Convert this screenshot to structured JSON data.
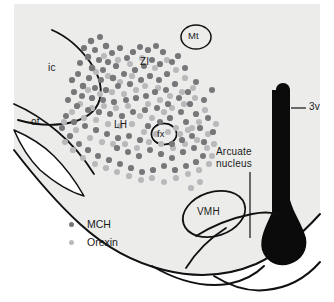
{
  "figure": {
    "kind": "hypothalamus-coronal-section-schematic",
    "background_color": "#ffffff",
    "tissue_fill": "#ececeb",
    "tissue_fill_dark": "#e4e4e3",
    "outline_color": "#111111",
    "ventricle_fill": "#0b0b0b",
    "text_color": "#1a1a1a"
  },
  "labels": {
    "ic": "ic",
    "ot": "ot",
    "zi": "ZI",
    "lh": "LH",
    "fx": "fx",
    "mt": "Mt",
    "third_ventricle": "3v",
    "vmh": "VMH",
    "arcuate_line1": "Arcuate",
    "arcuate_line2": "nucleus"
  },
  "legend": {
    "items": [
      {
        "label": "MCH",
        "color": "#77777a",
        "marker": "filled-circle"
      },
      {
        "label": "Orexin",
        "color": "#b9b9bb",
        "marker": "filled-circle"
      }
    ]
  },
  "markers": {
    "mch_color": "#77777a",
    "orexin_color": "#b9b9bb",
    "mch": [
      [
        91,
        41,
        3.2
      ],
      [
        100,
        37,
        3.0
      ],
      [
        84,
        48,
        3.1
      ],
      [
        95,
        50,
        3.0
      ],
      [
        106,
        46,
        3.2
      ],
      [
        112,
        53,
        3.0
      ],
      [
        120,
        48,
        3.1
      ],
      [
        88,
        57,
        3.2
      ],
      [
        99,
        60,
        3.0
      ],
      [
        108,
        62,
        3.1
      ],
      [
        80,
        63,
        3.0
      ],
      [
        92,
        68,
        3.2
      ],
      [
        103,
        70,
        3.0
      ],
      [
        116,
        66,
        3.1
      ],
      [
        127,
        58,
        3.0
      ],
      [
        133,
        52,
        3.1
      ],
      [
        140,
        47,
        3.0
      ],
      [
        148,
        50,
        3.1
      ],
      [
        156,
        46,
        3.0
      ],
      [
        163,
        52,
        3.1
      ],
      [
        152,
        60,
        3.0
      ],
      [
        160,
        64,
        3.1
      ],
      [
        144,
        66,
        3.0
      ],
      [
        135,
        70,
        3.1
      ],
      [
        124,
        74,
        3.0
      ],
      [
        113,
        78,
        3.2
      ],
      [
        101,
        80,
        3.0
      ],
      [
        89,
        78,
        3.1
      ],
      [
        78,
        74,
        3.0
      ],
      [
        72,
        80,
        3.1
      ],
      [
        83,
        86,
        3.2
      ],
      [
        95,
        88,
        3.0
      ],
      [
        106,
        90,
        3.1
      ],
      [
        118,
        86,
        3.0
      ],
      [
        130,
        84,
        3.1
      ],
      [
        141,
        80,
        3.0
      ],
      [
        150,
        76,
        3.1
      ],
      [
        159,
        80,
        3.0
      ],
      [
        167,
        74,
        3.1
      ],
      [
        172,
        62,
        3.0
      ],
      [
        178,
        56,
        3.1
      ],
      [
        185,
        68,
        3.0
      ],
      [
        175,
        84,
        3.1
      ],
      [
        166,
        90,
        3.0
      ],
      [
        155,
        92,
        3.1
      ],
      [
        146,
        96,
        3.0
      ],
      [
        136,
        98,
        3.1
      ],
      [
        126,
        100,
        3.0
      ],
      [
        114,
        102,
        3.1
      ],
      [
        103,
        100,
        3.0
      ],
      [
        92,
        98,
        3.1
      ],
      [
        82,
        96,
        3.0
      ],
      [
        74,
        92,
        3.1
      ],
      [
        68,
        100,
        3.0
      ],
      [
        77,
        106,
        3.1
      ],
      [
        88,
        110,
        3.0
      ],
      [
        99,
        112,
        3.1
      ],
      [
        110,
        114,
        3.0
      ],
      [
        122,
        116,
        3.1
      ],
      [
        133,
        112,
        3.0
      ],
      [
        145,
        110,
        3.1
      ],
      [
        157,
        108,
        3.0
      ],
      [
        168,
        104,
        3.1
      ],
      [
        179,
        98,
        3.0
      ],
      [
        188,
        92,
        3.1
      ],
      [
        196,
        82,
        3.0
      ],
      [
        190,
        104,
        3.1
      ],
      [
        181,
        112,
        3.0
      ],
      [
        170,
        118,
        3.1
      ],
      [
        160,
        122,
        3.0
      ],
      [
        148,
        126,
        3.1
      ],
      [
        186,
        122,
        3.0
      ],
      [
        196,
        114,
        3.1
      ],
      [
        204,
        100,
        3.0
      ],
      [
        200,
        128,
        3.1
      ],
      [
        192,
        136,
        3.0
      ],
      [
        182,
        140,
        3.1
      ],
      [
        172,
        144,
        3.0
      ],
      [
        140,
        140,
        3.1
      ],
      [
        129,
        136,
        3.0
      ],
      [
        118,
        138,
        3.1
      ],
      [
        107,
        134,
        3.0
      ],
      [
        96,
        130,
        3.1
      ],
      [
        85,
        126,
        3.0
      ],
      [
        74,
        122,
        3.1
      ],
      [
        66,
        116,
        3.0
      ],
      [
        117,
        148,
        3.1
      ],
      [
        128,
        152,
        3.0
      ],
      [
        139,
        156,
        3.1
      ],
      [
        150,
        150,
        3.0
      ],
      [
        161,
        154,
        3.1
      ],
      [
        172,
        158,
        3.0
      ],
      [
        183,
        152,
        3.1
      ],
      [
        194,
        148,
        3.0
      ],
      [
        204,
        142,
        3.1
      ],
      [
        203,
        156,
        3.0
      ],
      [
        196,
        162,
        3.1
      ],
      [
        186,
        166,
        3.0
      ],
      [
        175,
        170,
        3.1
      ],
      [
        164,
        166,
        3.0
      ],
      [
        153,
        170,
        3.1
      ],
      [
        142,
        172,
        3.0
      ],
      [
        131,
        168,
        3.1
      ],
      [
        120,
        164,
        3.0
      ],
      [
        109,
        160,
        3.1
      ],
      [
        98,
        156,
        3.0
      ],
      [
        88,
        150,
        3.1
      ],
      [
        79,
        144,
        3.0
      ],
      [
        70,
        136,
        3.1
      ],
      [
        62,
        128,
        3.0
      ],
      [
        208,
        118,
        3.0
      ],
      [
        213,
        132,
        3.1
      ],
      [
        212,
        90,
        3.0
      ]
    ],
    "orexin": [
      [
        104,
        56,
        3.0
      ],
      [
        118,
        60,
        3.1
      ],
      [
        130,
        64,
        3.0
      ],
      [
        142,
        58,
        3.1
      ],
      [
        155,
        68,
        3.0
      ],
      [
        167,
        60,
        3.1
      ],
      [
        176,
        70,
        3.0
      ],
      [
        185,
        78,
        3.1
      ],
      [
        96,
        72,
        3.0
      ],
      [
        108,
        76,
        3.1
      ],
      [
        120,
        82,
        3.0
      ],
      [
        132,
        76,
        3.1
      ],
      [
        145,
        86,
        3.0
      ],
      [
        158,
        88,
        3.1
      ],
      [
        170,
        96,
        3.0
      ],
      [
        182,
        92,
        3.1
      ],
      [
        193,
        88,
        3.0
      ],
      [
        88,
        90,
        3.1
      ],
      [
        100,
        94,
        3.0
      ],
      [
        112,
        92,
        3.1
      ],
      [
        124,
        94,
        3.0
      ],
      [
        136,
        90,
        3.1
      ],
      [
        148,
        104,
        3.0
      ],
      [
        160,
        100,
        3.1
      ],
      [
        172,
        108,
        3.0
      ],
      [
        184,
        104,
        3.1
      ],
      [
        195,
        98,
        3.0
      ],
      [
        205,
        110,
        3.1
      ],
      [
        80,
        104,
        3.0
      ],
      [
        92,
        108,
        3.1
      ],
      [
        104,
        106,
        3.0
      ],
      [
        116,
        108,
        3.1
      ],
      [
        128,
        106,
        3.0
      ],
      [
        140,
        116,
        3.1
      ],
      [
        152,
        118,
        3.0
      ],
      [
        164,
        112,
        3.1
      ],
      [
        176,
        128,
        3.0
      ],
      [
        188,
        130,
        3.1
      ],
      [
        199,
        122,
        3.0
      ],
      [
        208,
        134,
        3.1
      ],
      [
        72,
        112,
        3.0
      ],
      [
        84,
        118,
        3.1
      ],
      [
        96,
        120,
        3.0
      ],
      [
        108,
        124,
        3.1
      ],
      [
        120,
        126,
        3.0
      ],
      [
        132,
        124,
        3.1
      ],
      [
        144,
        132,
        3.0
      ],
      [
        156,
        134,
        3.1
      ],
      [
        168,
        132,
        3.0
      ],
      [
        180,
        134,
        3.1
      ],
      [
        192,
        128,
        3.1
      ],
      [
        64,
        122,
        3.0
      ],
      [
        76,
        130,
        3.1
      ],
      [
        90,
        138,
        3.0
      ],
      [
        102,
        142,
        3.1
      ],
      [
        113,
        144,
        3.0
      ],
      [
        125,
        144,
        3.1
      ],
      [
        137,
        148,
        3.0
      ],
      [
        149,
        142,
        3.1
      ],
      [
        161,
        144,
        3.0
      ],
      [
        173,
        148,
        3.1
      ],
      [
        185,
        144,
        3.0
      ],
      [
        197,
        140,
        3.1
      ],
      [
        207,
        148,
        3.0
      ],
      [
        95,
        164,
        3.0
      ],
      [
        106,
        168,
        3.1
      ],
      [
        117,
        172,
        3.0
      ],
      [
        129,
        176,
        3.1
      ],
      [
        141,
        180,
        3.0
      ],
      [
        152,
        178,
        3.1
      ],
      [
        164,
        182,
        3.0
      ],
      [
        176,
        178,
        3.1
      ],
      [
        188,
        174,
        3.0
      ],
      [
        199,
        170,
        3.1
      ],
      [
        209,
        164,
        3.1
      ],
      [
        83,
        158,
        3.0
      ],
      [
        73,
        150,
        3.1
      ],
      [
        65,
        142,
        3.0
      ],
      [
        200,
        182,
        3.0
      ],
      [
        191,
        188,
        3.1
      ],
      [
        212,
        156,
        3.0
      ],
      [
        214,
        144,
        3.1
      ],
      [
        216,
        124,
        3.0
      ]
    ]
  }
}
